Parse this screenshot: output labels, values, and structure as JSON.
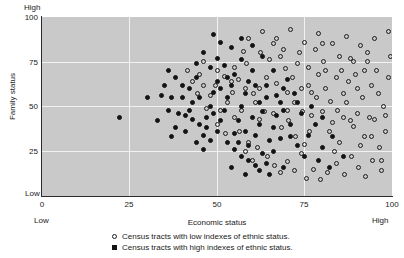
{
  "chart_data": {
    "type": "scatter",
    "title": "",
    "xlabel": "Economic status",
    "ylabel": "Family status",
    "xlim": [
      0,
      100
    ],
    "ylim": [
      0,
      100
    ],
    "xticks": [
      "0",
      "25",
      "50",
      "75",
      "100"
    ],
    "yticks": [
      "25",
      "50",
      "75",
      "100"
    ],
    "xtick_values": [
      0,
      25,
      50,
      75,
      100
    ],
    "ytick_values": [
      25,
      50,
      75,
      100
    ],
    "grid": true,
    "gridlines_x": [
      25,
      50,
      75
    ],
    "gridlines_y": [
      25,
      50,
      75
    ],
    "axis_end_labels": {
      "x_low": "Low",
      "x_high": "High",
      "y_low": "Low",
      "y_high": "High"
    },
    "plot_background_color": "#c9c9c9",
    "gridline_color": "#f2f2f2",
    "marker_color": "#141414",
    "legend_position": "below",
    "series": [
      {
        "name": "Census tracts with low indexes of ethnic status.",
        "marker": "open-circle",
        "points": [
          [
            56,
            65
          ],
          [
            60.5,
            57
          ],
          [
            61,
            52.5
          ],
          [
            64,
            66
          ],
          [
            58.5,
            74
          ],
          [
            62,
            43
          ],
          [
            63.5,
            47
          ],
          [
            56.5,
            36
          ],
          [
            59,
            30
          ],
          [
            61.5,
            27
          ],
          [
            66,
            85
          ],
          [
            68,
            78
          ],
          [
            69.5,
            71
          ],
          [
            67,
            63
          ],
          [
            70,
            58
          ],
          [
            71.5,
            66
          ],
          [
            73,
            74
          ],
          [
            72,
            52
          ],
          [
            74.5,
            47
          ],
          [
            70.5,
            42
          ],
          [
            68.5,
            38
          ],
          [
            72.5,
            33
          ],
          [
            75,
            29
          ],
          [
            76.5,
            36
          ],
          [
            74,
            24
          ],
          [
            77,
            45
          ],
          [
            78.5,
            55
          ],
          [
            76,
            62
          ],
          [
            79,
            68
          ],
          [
            80.5,
            75
          ],
          [
            78,
            82
          ],
          [
            81,
            60
          ],
          [
            82.5,
            53
          ],
          [
            80,
            47
          ],
          [
            83,
            41
          ],
          [
            84.5,
            48
          ],
          [
            82,
            36
          ],
          [
            85,
            30
          ],
          [
            83.5,
            25
          ],
          [
            86,
            57
          ],
          [
            87.5,
            64
          ],
          [
            85.5,
            70
          ],
          [
            88,
            77
          ],
          [
            89.5,
            68
          ],
          [
            87,
            52
          ],
          [
            90,
            46
          ],
          [
            91.5,
            55
          ],
          [
            89,
            39
          ],
          [
            92,
            33
          ],
          [
            93.5,
            44
          ],
          [
            91,
            28
          ],
          [
            94,
            62
          ],
          [
            95.5,
            70
          ],
          [
            93,
            75
          ],
          [
            96,
            57
          ],
          [
            97.5,
            50
          ],
          [
            95,
            43
          ],
          [
            98,
            36
          ],
          [
            99,
            66
          ],
          [
            96.5,
            27
          ],
          [
            99.5,
            78
          ],
          [
            97,
            20
          ],
          [
            64.5,
            22
          ],
          [
            66.5,
            17
          ],
          [
            68,
            13
          ],
          [
            70,
            19
          ],
          [
            72,
            14
          ],
          [
            75.5,
            10
          ],
          [
            77.5,
            15
          ],
          [
            79.5,
            9
          ],
          [
            81.5,
            13
          ],
          [
            84,
            18
          ],
          [
            86.5,
            12
          ],
          [
            88.5,
            22
          ],
          [
            90.5,
            16
          ],
          [
            92.5,
            11
          ],
          [
            94.5,
            20
          ],
          [
            97,
            14
          ],
          [
            60,
            20
          ],
          [
            58,
            25
          ],
          [
            55,
            44
          ],
          [
            53,
            52
          ],
          [
            51,
            48
          ],
          [
            54.5,
            58
          ],
          [
            57,
            48
          ],
          [
            50,
            40
          ],
          [
            52.5,
            35
          ],
          [
            48,
            56
          ],
          [
            49.5,
            62
          ],
          [
            47,
            49
          ],
          [
            46,
            62
          ],
          [
            44.5,
            57
          ],
          [
            52,
            67
          ],
          [
            55,
            72
          ],
          [
            57.5,
            81
          ],
          [
            59,
            88
          ],
          [
            63,
            92
          ],
          [
            67,
            88
          ],
          [
            71,
            93
          ],
          [
            75,
            86
          ],
          [
            79,
            91
          ],
          [
            83,
            85
          ],
          [
            87,
            89
          ],
          [
            91,
            84
          ],
          [
            95,
            88
          ],
          [
            99,
            92
          ],
          [
            62.5,
            80
          ],
          [
            65,
            76
          ],
          [
            69,
            82
          ],
          [
            73.5,
            80
          ],
          [
            45,
            68
          ],
          [
            43,
            64
          ],
          [
            41.5,
            70
          ],
          [
            88,
            42
          ],
          [
            92,
            70
          ],
          [
            94,
            33
          ],
          [
            86,
            44
          ],
          [
            90,
            60
          ],
          [
            98,
            45
          ],
          [
            84,
            66
          ],
          [
            76,
            72
          ],
          [
            80,
            85
          ],
          [
            74,
            60
          ],
          [
            66,
            46
          ],
          [
            70,
            48
          ],
          [
            62,
            60
          ],
          [
            58,
            60
          ],
          [
            54,
            64
          ],
          [
            50,
            70
          ],
          [
            46,
            75
          ],
          [
            93,
            80
          ],
          [
            89,
            75
          ],
          [
            85,
            78
          ],
          [
            81,
            70
          ],
          [
            77,
            58
          ]
        ]
      },
      {
        "name": "Census tracts with high indexes of ethnic status.",
        "marker": "filled-circle",
        "points": [
          [
            22,
            44
          ],
          [
            30,
            55
          ],
          [
            34,
            56
          ],
          [
            37,
            55
          ],
          [
            40,
            55
          ],
          [
            33,
            42
          ],
          [
            36,
            48
          ],
          [
            38,
            38
          ],
          [
            41,
            45
          ],
          [
            43,
            52
          ],
          [
            42,
            60
          ],
          [
            44,
            66
          ],
          [
            45,
            40
          ],
          [
            46,
            34
          ],
          [
            47,
            44
          ],
          [
            48,
            50
          ],
          [
            49,
            58
          ],
          [
            50,
            64
          ],
          [
            44,
            30
          ],
          [
            46,
            26
          ],
          [
            48,
            31
          ],
          [
            50,
            36
          ],
          [
            51,
            42
          ],
          [
            52,
            48
          ],
          [
            53,
            55
          ],
          [
            54,
            62
          ],
          [
            55,
            68
          ],
          [
            52,
            73
          ],
          [
            50,
            77
          ],
          [
            48,
            72
          ],
          [
            53,
            30
          ],
          [
            55,
            35
          ],
          [
            56,
            42
          ],
          [
            57,
            50
          ],
          [
            58,
            57
          ],
          [
            59,
            64
          ],
          [
            60,
            70
          ],
          [
            57,
            76
          ],
          [
            55,
            26
          ],
          [
            57,
            22
          ],
          [
            59,
            28
          ],
          [
            61,
            34
          ],
          [
            62,
            40
          ],
          [
            63,
            47
          ],
          [
            64,
            55
          ],
          [
            61,
            62
          ],
          [
            59,
            20
          ],
          [
            61,
            17
          ],
          [
            63,
            24
          ],
          [
            65,
            31
          ],
          [
            66,
            38
          ],
          [
            67,
            45
          ],
          [
            64,
            18
          ],
          [
            66,
            25
          ],
          [
            68,
            52
          ],
          [
            69,
            60
          ],
          [
            44,
            74
          ],
          [
            46,
            80
          ],
          [
            42,
            48
          ],
          [
            40,
            62
          ],
          [
            38,
            66
          ],
          [
            36,
            70
          ],
          [
            51,
            86
          ],
          [
            54,
            83
          ],
          [
            49,
            90
          ],
          [
            57,
            88
          ],
          [
            60,
            84
          ],
          [
            63,
            78
          ],
          [
            66,
            70
          ],
          [
            70,
            65
          ],
          [
            72,
            57
          ],
          [
            68,
            32
          ],
          [
            71,
            40
          ],
          [
            74,
            46
          ],
          [
            73,
            28
          ],
          [
            76,
            34
          ],
          [
            78,
            40
          ],
          [
            80,
            27
          ],
          [
            83,
            33
          ],
          [
            86,
            22
          ],
          [
            39,
            46
          ],
          [
            41,
            36
          ],
          [
            37,
            33
          ],
          [
            35,
            62
          ],
          [
            43,
            43
          ],
          [
            47,
            38
          ],
          [
            45,
            55
          ],
          [
            49,
            46
          ],
          [
            51,
            60
          ],
          [
            53,
            66
          ],
          [
            56,
            30
          ],
          [
            58,
            36
          ],
          [
            60,
            44
          ],
          [
            62,
            52
          ],
          [
            64,
            62
          ],
          [
            67,
            56
          ],
          [
            69,
            48
          ],
          [
            71,
            33
          ],
          [
            73,
            52
          ],
          [
            75,
            22
          ],
          [
            65,
            12
          ],
          [
            69,
            16
          ],
          [
            62,
            14
          ],
          [
            58,
            12
          ],
          [
            54,
            16
          ],
          [
            80,
            44
          ],
          [
            77,
            50
          ],
          [
            79,
            20
          ],
          [
            82,
            16
          ]
        ]
      }
    ]
  },
  "legend": {
    "items": [
      {
        "label": "Census tracts with low indexes of ethnic status.",
        "marker": "open-circle"
      },
      {
        "label": "Census tracts with high indexes of ethnic status.",
        "marker": "filled-circle"
      }
    ]
  }
}
